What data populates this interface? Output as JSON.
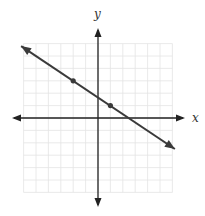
{
  "chart_data": {
    "type": "line",
    "title": "",
    "xlabel": "x",
    "ylabel": "y",
    "xlim": [
      -6,
      6
    ],
    "ylim": [
      -6,
      6
    ],
    "grid": true,
    "grid_step": 1,
    "tick_labels": false,
    "series": [
      {
        "name": "line",
        "equation": "y = -2/3 x + 5/3",
        "slope": -0.6667,
        "y_intercept": 1.6667,
        "x_intercept": 2.5,
        "arrows_both_ends": true,
        "x": [
          -6.2,
          6.2
        ],
        "y": [
          5.8,
          -2.5
        ]
      }
    ],
    "points": [
      {
        "x": -2,
        "y": 3
      },
      {
        "x": 1,
        "y": 1
      }
    ],
    "colors": {
      "line": "#3a3a3a",
      "axis": "#222222",
      "grid": "#e4e4e4"
    }
  }
}
